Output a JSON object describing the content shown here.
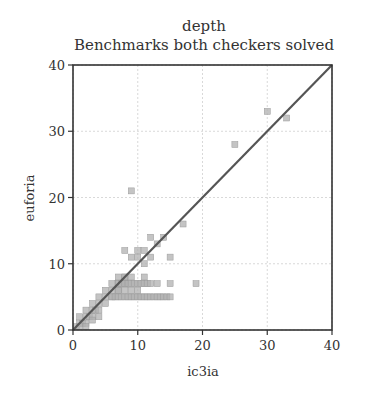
{
  "chart_data": {
    "type": "scatter",
    "title": "depth",
    "subtitle": "Benchmarks both checkers solved",
    "xlabel": "ic3ia",
    "ylabel": "euforia",
    "xlim": [
      0,
      40
    ],
    "ylim": [
      0,
      40
    ],
    "xticks": [
      0,
      10,
      20,
      30,
      40
    ],
    "yticks": [
      0,
      10,
      20,
      30,
      40
    ],
    "grid": true,
    "reference_line": {
      "from": [
        0,
        0
      ],
      "to": [
        40,
        40
      ],
      "label": "y = x"
    },
    "series": [
      {
        "name": "benchmarks",
        "marker": "square",
        "color": "#b0b0b0",
        "points": [
          [
            0.5,
            0.5
          ],
          [
            1,
            1
          ],
          [
            1,
            2
          ],
          [
            1.5,
            1
          ],
          [
            2,
            1
          ],
          [
            2,
            2
          ],
          [
            2,
            3
          ],
          [
            2.5,
            2
          ],
          [
            3,
            2
          ],
          [
            3,
            3
          ],
          [
            3,
            4
          ],
          [
            3.5,
            3
          ],
          [
            4,
            3
          ],
          [
            4,
            4
          ],
          [
            4,
            5
          ],
          [
            5,
            4
          ],
          [
            5,
            5
          ],
          [
            5,
            6
          ],
          [
            6,
            5
          ],
          [
            6,
            6
          ],
          [
            6,
            7
          ],
          [
            7,
            6
          ],
          [
            7,
            7
          ],
          [
            7,
            8
          ],
          [
            8,
            7
          ],
          [
            8,
            8
          ],
          [
            3,
            1.5
          ],
          [
            4,
            2
          ],
          [
            2,
            0.5
          ],
          [
            1,
            0.5
          ],
          [
            6,
            5
          ],
          [
            6.5,
            5
          ],
          [
            7,
            5
          ],
          [
            7.5,
            5
          ],
          [
            8,
            5
          ],
          [
            8.5,
            5
          ],
          [
            9,
            5
          ],
          [
            9.5,
            5
          ],
          [
            10,
            5
          ],
          [
            10.5,
            5
          ],
          [
            11,
            5
          ],
          [
            11.5,
            5
          ],
          [
            12,
            5
          ],
          [
            12.5,
            5
          ],
          [
            13,
            5
          ],
          [
            13.5,
            5
          ],
          [
            14,
            5
          ],
          [
            14.5,
            5
          ],
          [
            15,
            5
          ],
          [
            7,
            6
          ],
          [
            8,
            6
          ],
          [
            9,
            6
          ],
          [
            10,
            6
          ],
          [
            7,
            7
          ],
          [
            7.5,
            7
          ],
          [
            8,
            7
          ],
          [
            8.5,
            7
          ],
          [
            9,
            7
          ],
          [
            9.5,
            7
          ],
          [
            10,
            7
          ],
          [
            10.5,
            7
          ],
          [
            11,
            7
          ],
          [
            11.5,
            7
          ],
          [
            12,
            7
          ],
          [
            13,
            7
          ],
          [
            15,
            7
          ],
          [
            19,
            7
          ],
          [
            8,
            8
          ],
          [
            9,
            8
          ],
          [
            11,
            8
          ],
          [
            9,
            11
          ],
          [
            10,
            11
          ],
          [
            11,
            10
          ],
          [
            12,
            11
          ],
          [
            15,
            11
          ],
          [
            8,
            12
          ],
          [
            10,
            12
          ],
          [
            11,
            12
          ],
          [
            12,
            14
          ],
          [
            13,
            13
          ],
          [
            14,
            14
          ],
          [
            17,
            16
          ],
          [
            9,
            21
          ],
          [
            25,
            28
          ],
          [
            30,
            33
          ],
          [
            33,
            32
          ]
        ]
      }
    ]
  }
}
